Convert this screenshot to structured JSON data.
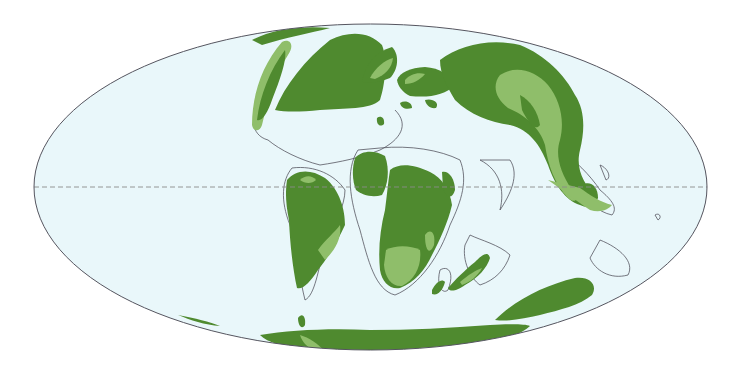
{
  "map": {
    "projection": "Mollweide",
    "equator_line": "dashed",
    "colors": {
      "ocean": "#e9f7fa",
      "background": "#ffffff",
      "land_dark": "#4f8a2f",
      "land_light": "#8fbe6a",
      "coastline": "#55555f",
      "graticule": "#8a8a8a"
    },
    "landmasses": [
      "North America",
      "Greenland",
      "Europe",
      "Asia",
      "South America",
      "Africa",
      "India",
      "Madagascar",
      "Antarctica",
      "Australia",
      "Southeast Asia"
    ]
  }
}
